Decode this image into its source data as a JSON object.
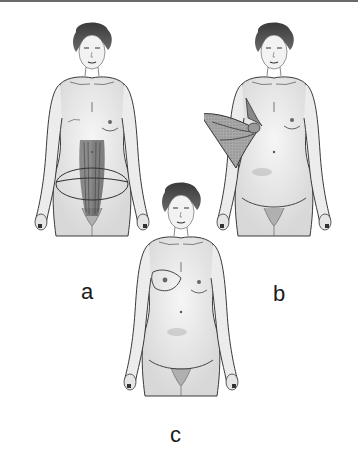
{
  "figure": {
    "panels": [
      {
        "id": "a",
        "label": "a",
        "description": "Abdominal donor site with rectus muscles and elliptical lower abdominal incision"
      },
      {
        "id": "b",
        "label": "b",
        "description": "Flap rotated from lateral back/axilla to chest wall"
      },
      {
        "id": "c",
        "label": "c",
        "description": "Result: reconstructed breast with low abdominal scar"
      }
    ]
  },
  "colors": {
    "skin": "#efefef",
    "outline": "#3a3a3a",
    "hair": "#4a4a4a",
    "muscle": "#5a5a5a",
    "flap": "#9a9a9a",
    "background": "#ffffff"
  }
}
